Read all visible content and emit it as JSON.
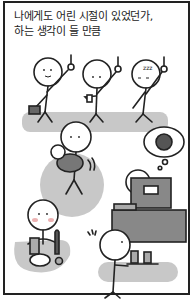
{
  "caption": {
    "line1": "나에게도 어린 시절이 있었던가,",
    "line2": "하는 생각이 들 만큼"
  },
  "scenes": [
    {
      "name": "commuters-on-subway",
      "description": "three stick figures holding subway handles, one with briefcase, one with cup, one sleepy"
    },
    {
      "name": "parent-holding-baby",
      "description": "figure holding a baby in gray circle"
    },
    {
      "name": "worker-at-computer",
      "description": "figure at desk with computer dreaming of noodles"
    },
    {
      "name": "person-drinking",
      "description": "figure at table with bottle, beer glass and plate"
    },
    {
      "name": "server-with-tray",
      "description": "sweating figure carrying tray with drinks"
    }
  ],
  "sleep_text": "zzz",
  "colors": {
    "ink": "#222222",
    "shade": "#bdbdbd",
    "dark": "#666666",
    "blush": "#e8a0a0"
  }
}
